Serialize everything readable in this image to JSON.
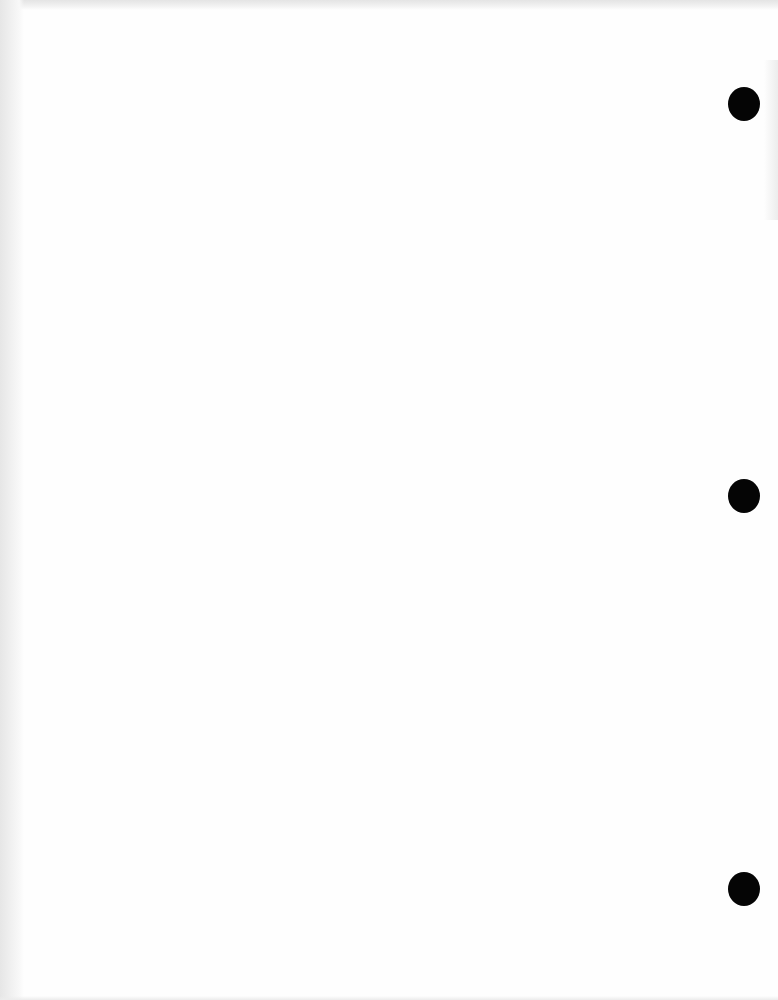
{
  "document": {
    "type": "blank scanned page",
    "background_color": "#fefefe",
    "edge_shadow_color": "#e6e6e6",
    "punch_holes": [
      {
        "cx": 744,
        "cy": 104,
        "diameter": 32
      },
      {
        "cx": 744,
        "cy": 496,
        "diameter": 32
      },
      {
        "cx": 744,
        "cy": 889,
        "diameter": 32
      }
    ],
    "hole_color": "#050505"
  }
}
